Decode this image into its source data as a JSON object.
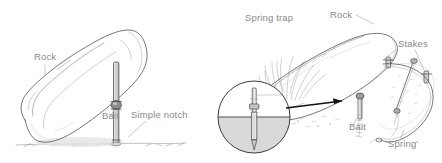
{
  "figure": {
    "style": "pencil line drawing",
    "background_color": "#ffffff",
    "ink_color": "#4a4a4a",
    "label_color": "#8a8a8a",
    "arrow_color": "#111111"
  },
  "panels": [
    {
      "id": "simple-deadfall",
      "name": "Simple notch deadfall",
      "labels": [
        {
          "key": "rock",
          "text": "Rock",
          "x": 34,
          "y": 60,
          "anchor": "start"
        },
        {
          "key": "bait",
          "text": "Bait",
          "x": 102,
          "y": 119,
          "anchor": "start"
        },
        {
          "key": "notch",
          "text": "Simple notch",
          "x": 131,
          "y": 118,
          "anchor": "start"
        }
      ]
    },
    {
      "id": "spring-trap",
      "name": "Spring trap",
      "labels": [
        {
          "key": "springtrap",
          "text": "Spring trap",
          "x": 245,
          "y": 21,
          "anchor": "start"
        },
        {
          "key": "rock",
          "text": "Rock",
          "x": 330,
          "y": 18,
          "anchor": "start"
        },
        {
          "key": "stakes",
          "text": "Stakes",
          "x": 398,
          "y": 47,
          "anchor": "start"
        },
        {
          "key": "bait",
          "text": "Bait",
          "x": 349,
          "y": 130,
          "anchor": "start"
        },
        {
          "key": "spring",
          "text": "'Spring'",
          "x": 386,
          "y": 147,
          "anchor": "start"
        }
      ]
    }
  ],
  "inset": {
    "name": "magnified stake detail",
    "shape": "circle",
    "center_x": 254,
    "center_y": 117,
    "radius": 36,
    "ground_shading": "#d9d9d9"
  }
}
